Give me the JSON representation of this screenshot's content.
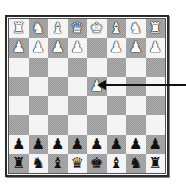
{
  "board": {
    "files": [
      "a",
      "b",
      "c",
      "d",
      "e",
      "f",
      "g",
      "h"
    ],
    "ranks": [
      8,
      7,
      6,
      5,
      4,
      3,
      2,
      1
    ],
    "light_color": "#f4f4f4",
    "dark_color": "#9a9a9a",
    "rows": [
      [
        {
          "piece": "rook",
          "color": "white",
          "glyph": "♜"
        },
        {
          "piece": "knight",
          "color": "white",
          "glyph": "♞"
        },
        {
          "piece": "bishop",
          "color": "white",
          "glyph": "♝"
        },
        {
          "piece": "queen",
          "color": "white",
          "glyph": "♛"
        },
        {
          "piece": "king",
          "color": "white",
          "glyph": "♚"
        },
        {
          "piece": "bishop",
          "color": "white",
          "glyph": "♝"
        },
        {
          "piece": "knight",
          "color": "white",
          "glyph": "♞"
        },
        {
          "piece": "rook",
          "color": "white",
          "glyph": "♜"
        }
      ],
      [
        {
          "piece": "pawn",
          "color": "white",
          "glyph": "♟"
        },
        {
          "piece": "pawn",
          "color": "white",
          "glyph": "♟"
        },
        {
          "piece": "pawn",
          "color": "white",
          "glyph": "♟"
        },
        {
          "piece": "pawn",
          "color": "white",
          "glyph": "♟"
        },
        null,
        {
          "piece": "pawn",
          "color": "white",
          "glyph": "♟"
        },
        {
          "piece": "pawn",
          "color": "white",
          "glyph": "♟"
        },
        {
          "piece": "pawn",
          "color": "white",
          "glyph": "♟"
        }
      ],
      [
        null,
        null,
        null,
        null,
        null,
        null,
        null,
        null
      ],
      [
        null,
        null,
        null,
        null,
        {
          "piece": "pawn",
          "color": "white",
          "glyph": "♟"
        },
        null,
        null,
        null
      ],
      [
        null,
        null,
        null,
        null,
        null,
        null,
        null,
        null
      ],
      [
        null,
        null,
        null,
        null,
        null,
        null,
        null,
        null
      ],
      [
        {
          "piece": "pawn",
          "color": "black",
          "glyph": "♟"
        },
        {
          "piece": "pawn",
          "color": "black",
          "glyph": "♟"
        },
        {
          "piece": "pawn",
          "color": "black",
          "glyph": "♟"
        },
        {
          "piece": "pawn",
          "color": "black",
          "glyph": "♟"
        },
        {
          "piece": "pawn",
          "color": "black",
          "glyph": "♟"
        },
        {
          "piece": "pawn",
          "color": "black",
          "glyph": "♟"
        },
        {
          "piece": "pawn",
          "color": "black",
          "glyph": "♟"
        },
        {
          "piece": "pawn",
          "color": "black",
          "glyph": "♟"
        }
      ],
      [
        {
          "piece": "rook",
          "color": "black",
          "glyph": "♜"
        },
        {
          "piece": "knight",
          "color": "black",
          "glyph": "♞"
        },
        {
          "piece": "bishop",
          "color": "black",
          "glyph": "♝"
        },
        {
          "piece": "queen",
          "color": "black",
          "glyph": "♛"
        },
        {
          "piece": "king",
          "color": "black",
          "glyph": "♚"
        },
        {
          "piece": "bishop",
          "color": "black",
          "glyph": "♝"
        },
        {
          "piece": "knight",
          "color": "black",
          "glyph": "♞"
        },
        {
          "piece": "rook",
          "color": "black",
          "glyph": "♜"
        }
      ]
    ]
  },
  "annotation": {
    "type": "arrow",
    "points_to": "moved-pawn",
    "target_row": 3,
    "target_col": 4,
    "color": "#111111"
  }
}
